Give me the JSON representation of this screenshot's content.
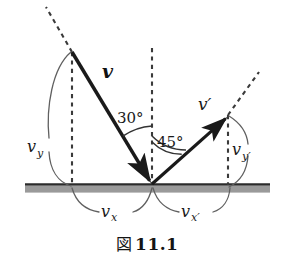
{
  "figure": {
    "caption_figure_word": "図",
    "caption_number": "11.1",
    "labels": {
      "incoming_vector": "v",
      "outgoing_vector": "v′",
      "incoming_angle": "30°",
      "outgoing_angle": "45°",
      "incoming_vertical_component": "v",
      "incoming_vertical_sub": "y",
      "incoming_horizontal_component": "v",
      "incoming_horizontal_sub": "x",
      "outgoing_vertical_component": "v",
      "outgoing_vertical_sub": "y′",
      "outgoing_horizontal_component": "v",
      "outgoing_horizontal_sub": "x′"
    },
    "colors": {
      "vector_stroke": "#1a1a1a",
      "dashed_stroke": "#3a3a3a",
      "arc_stroke": "#555555",
      "ground_line": "#2b2b2b",
      "ground_band": "#9a9a9a",
      "background": "#ffffff",
      "text": "#141414"
    },
    "geometry": {
      "vertex_x": 152,
      "vertex_y": 184,
      "incoming_tail_x": 72,
      "incoming_tail_y": 52,
      "outgoing_tip_x": 228,
      "outgoing_tip_y": 115,
      "ground_left_x": 25,
      "ground_right_x": 270,
      "ground_y": 184,
      "incoming_angle_deg": 30,
      "outgoing_angle_deg": 45
    }
  }
}
